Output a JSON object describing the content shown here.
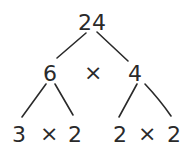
{
  "diagram": {
    "type": "factor-tree",
    "root": {
      "label": "24"
    },
    "level1": {
      "left": {
        "label": "6"
      },
      "operator": "×",
      "right": {
        "label": "4"
      }
    },
    "level2": {
      "left_pair": {
        "left": "3",
        "operator": "×",
        "right": "2"
      },
      "right_pair": {
        "left": "2",
        "operator": "×",
        "right": "2"
      }
    },
    "colors": {
      "ink": "#2a2a2a",
      "background": "#ffffff"
    }
  }
}
